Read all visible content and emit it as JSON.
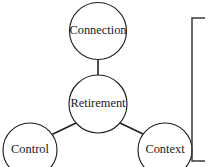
{
  "diagram": {
    "background_color": "#ffffff",
    "stroke_color": "#1f1f1f",
    "text_color": "#1a1a1a",
    "bracket_color": "#3a3a3a",
    "nodes": [
      {
        "id": "connection",
        "label": "Connection",
        "cx": 98,
        "cy": 31,
        "r": 28.5,
        "font_size": 12.4,
        "role": "satellite-top"
      },
      {
        "id": "retirement",
        "label": "Retirement",
        "cx": 98,
        "cy": 104,
        "r": 29,
        "font_size": 12.4,
        "role": "center"
      },
      {
        "id": "control",
        "label": "Control",
        "cx": 30,
        "cy": 150,
        "r": 27,
        "font_size": 12.4,
        "role": "satellite-bottom-left"
      },
      {
        "id": "context",
        "label": "Context",
        "cx": 165,
        "cy": 150,
        "r": 27,
        "font_size": 12.4,
        "role": "satellite-bottom-right"
      }
    ],
    "connectors": [
      {
        "id": "connection-retirement",
        "from": "retirement",
        "to": "connection",
        "x1": 98,
        "y1": 75,
        "x2": 98,
        "y2": 60
      },
      {
        "id": "retirement-control",
        "from": "retirement",
        "to": "control",
        "x1": 76,
        "y1": 123,
        "x2": 53,
        "y2": 134
      },
      {
        "id": "retirement-context",
        "from": "retirement",
        "to": "context",
        "x1": 120,
        "y1": 123,
        "x2": 143,
        "y2": 134
      }
    ],
    "bracket": {
      "id": "right-bracket",
      "x": 192,
      "top": 18,
      "bottom": 161,
      "stub_length": 13
    }
  }
}
